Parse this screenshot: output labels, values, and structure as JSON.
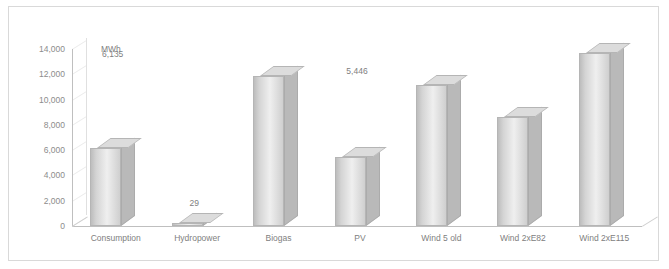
{
  "chart_data": {
    "type": "bar",
    "title": "",
    "subtitle": "",
    "unit_label": "MWh",
    "xlabel": "",
    "ylabel": "",
    "categories": [
      "Consumption",
      "Hydropower",
      "Biogas",
      "PV",
      "Wind 5 old",
      "Wind 2xE82",
      "Wind 2xE115"
    ],
    "values": [
      6135,
      29,
      11860,
      5446,
      11147,
      8640,
      13685
    ],
    "value_labels": [
      "6,135",
      "29",
      "11,860",
      "5,446",
      "11,147",
      "8,640",
      "13,685"
    ],
    "ylim": [
      0,
      14000
    ],
    "yticks": [
      0,
      2000,
      4000,
      6000,
      8000,
      10000,
      12000,
      14000
    ],
    "ytick_labels": [
      "0",
      "2,000",
      "4,000",
      "6,000",
      "8,000",
      "10,000",
      "12,000",
      "14,000"
    ],
    "grid": true,
    "legend": null,
    "legend_position": "none",
    "series": [
      {
        "name": "MWh",
        "values": [
          6135,
          29,
          11860,
          5446,
          11147,
          8640,
          13685
        ]
      }
    ],
    "colors": {
      "bar_face": "#d9d9d9",
      "bar_edge": "#b5b5b5",
      "grid": "#e6e6e6",
      "axis": "#bfbfbf",
      "text": "#808080",
      "frame": "#d9d9d9"
    }
  }
}
